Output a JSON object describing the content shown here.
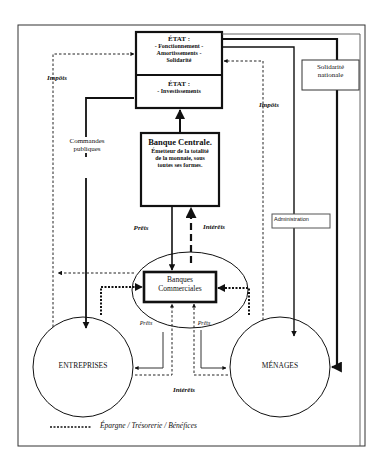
{
  "diagram": {
    "nodes": {
      "etat_fonctionnement": {
        "title": "ÉTAT :",
        "line1": "- Fonctionnement -",
        "line2": "Amortissements -",
        "line3": "Solidarité"
      },
      "etat_investissements": {
        "title": "ÉTAT :",
        "line1": "- Investissements"
      },
      "banque_centrale": {
        "title": "Banque Centrale.",
        "line1": "Émetteur de la totalité",
        "line2": "de la monnaie, sous",
        "line3": "toutes ses formes."
      },
      "banques_commerciales": {
        "line1": "Banques",
        "line2": "Commerciales"
      },
      "entreprises": {
        "label": "ENTREPRISES"
      },
      "menages": {
        "label": "MÉNAGES"
      },
      "solidarite": {
        "line1": "Solidarité",
        "line2": "nationale"
      },
      "administration": {
        "label": "Administration"
      }
    },
    "edge_labels": {
      "impots_left": "Impôts",
      "impots_right": "Impôts",
      "commandes_line1": "Commandes",
      "commandes_line2": "publiques",
      "prets_central": "Prêts",
      "interets_central": "Intérêts",
      "prets_entreprises": "Prêts",
      "prets_menages": "Prêts",
      "interets_bottom": "Intérêts"
    },
    "legend": {
      "dotted_label": "Épargne / Trésorerie / Bénéfices"
    }
  }
}
